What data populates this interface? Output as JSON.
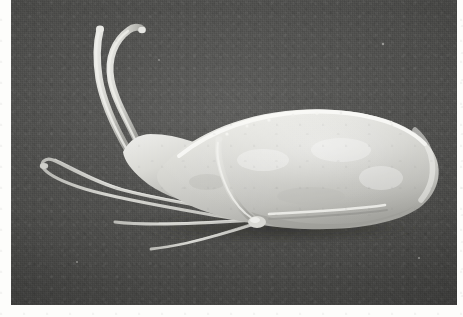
{
  "page": {
    "background_color": "#fdfdfb",
    "margins": {
      "left_px": 11,
      "right_px": 6,
      "bottom_px": 12,
      "top_px": 0
    }
  },
  "figure": {
    "kind": "scanning-electron-micrograph",
    "orientation": "specimen in lateral view, anterior to the left",
    "plate": {
      "x": 11,
      "y": 0,
      "width": 446,
      "height": 305,
      "background_color": "#4d4d4d",
      "background_description": "uniform dark grey grainy stub / filter-paper substrate"
    },
    "subject": {
      "name": "elongate shelled micro-organism",
      "common_reading": "pteropod-like mollusc with extended tentacles and long ciliary appendages",
      "body_color": "#d6d6d2",
      "body_highlight_color": "#f2f2ee",
      "body_shadow_color": "#8f8f8b",
      "shadow_color": "#3a3a38",
      "body": {
        "shape": "elongate teardrop / club shape, widest posteriorly, tapering to a narrow neck anteriorly",
        "left_x": 120,
        "right_x": 432,
        "top_y": 108,
        "bottom_y": 228,
        "posterior_end": "broadly rounded, brightest highlight along the dorsal rim",
        "dorsal_margin_detail": "row of minute papillae / debris specks along the dorsal crest",
        "ventral_detail": "bright linear aperture ridge running along the ventral margin"
      },
      "appendages": [
        {
          "id": "dorsal-tentacle-1",
          "label": "anterior tentacle (upper)",
          "description": "long, smooth, S-curved tentacle rising from the neck, tip slightly swollen",
          "tip": {
            "x": 98,
            "y": 28
          },
          "base": {
            "x": 128,
            "y": 150
          }
        },
        {
          "id": "dorsal-tentacle-2",
          "label": "anterior tentacle (lower)",
          "description": "second tentacle curving parallel to the first, hooked at the tip",
          "tip": {
            "x": 128,
            "y": 30
          },
          "base": {
            "x": 120,
            "y": 148
          }
        },
        {
          "id": "ventral-filament-1",
          "label": "long ventral filament (upper)",
          "description": "very long slender filament sweeping left and downward, looping back toward the body",
          "tip": {
            "x": 42,
            "y": 184
          },
          "base": {
            "x": 230,
            "y": 214
          }
        },
        {
          "id": "ventral-filament-2",
          "label": "long ventral filament (lower)",
          "description": "second slender filament running horizontally below the first, tapering to a fine point",
          "tip": {
            "x": 112,
            "y": 228
          },
          "base": {
            "x": 248,
            "y": 222
          }
        },
        {
          "id": "ventral-filament-3",
          "label": "short ventral filament",
          "description": "short fine filament splitting from the junction and trailing left",
          "tip": {
            "x": 146,
            "y": 248
          },
          "base": {
            "x": 246,
            "y": 224
          }
        },
        {
          "id": "median-appendage",
          "label": "median appendage over body",
          "description": "stout pale appendage arising on the body surface and curving down to the ventral junction knot",
          "top": {
            "x": 212,
            "y": 142
          },
          "base": {
            "x": 246,
            "y": 222
          }
        }
      ],
      "substrate_shadow": {
        "description": "dark cast shadow band beneath the ventral margin of the body",
        "x": 150,
        "y": 214,
        "width": 260,
        "height": 22
      }
    },
    "labels": [],
    "scale_bar": null,
    "caption": null
  }
}
